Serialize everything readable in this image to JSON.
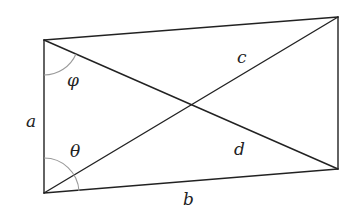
{
  "diagram": {
    "type": "quadrilateral-with-diagonals",
    "vertices": {
      "top_left": [
        44,
        40
      ],
      "bottom_left": [
        44,
        193
      ],
      "top_right": [
        338,
        17
      ],
      "bottom_right": [
        338,
        169
      ]
    },
    "labels": {
      "side_a": "a",
      "side_b": "b",
      "diagonal_c": "c",
      "diagonal_d": "d",
      "angle_phi": "φ",
      "angle_theta": "θ"
    },
    "colors": {
      "line": "#222222",
      "arc": "#9a9a9a",
      "background": "#ffffff"
    }
  }
}
